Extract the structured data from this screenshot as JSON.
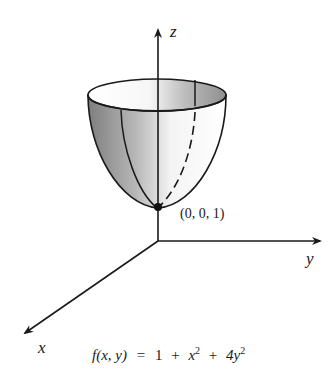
{
  "diagram": {
    "type": "3d-surface-plot",
    "surface": "elliptic paraboloid (bowl)",
    "axes": {
      "z_label": "z",
      "y_label": "y",
      "x_label": "x"
    },
    "point": {
      "label": "(0, 0, 1)"
    },
    "formula": {
      "lhs": "f(x, y)",
      "equals": "=",
      "parts": [
        "1",
        "+",
        "x",
        "2",
        "+",
        "4y",
        "2"
      ]
    },
    "colors": {
      "ink": "#1a1a1a",
      "shade_dark": "#8a8a8a",
      "shade_light": "#f2f2f2",
      "background": "#ffffff"
    }
  }
}
